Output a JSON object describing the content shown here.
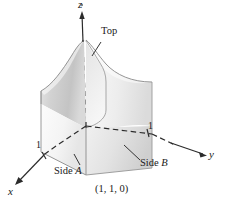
{
  "figure": {
    "caption_point": "(1, 1, 0)",
    "axes": [
      {
        "name": "z-axis",
        "label": "z"
      },
      {
        "name": "y-axis",
        "label": "y"
      },
      {
        "name": "x-axis",
        "label": "x"
      }
    ],
    "axis_labels": {
      "z": "z",
      "y": "y",
      "x": "x"
    },
    "ticks": {
      "x_tick": "1",
      "y_tick": "1"
    },
    "annotations": {
      "top": "Top",
      "side_a_word": "Side",
      "side_a_letter": "A",
      "side_b_word": "Side",
      "side_b_letter": "B"
    },
    "colors": {
      "axis_line": "#2b2b2b",
      "outline": "#6f6f6f",
      "surface_light": "#f4f4f4",
      "surface_mid": "#dcdcdc",
      "surface_dark": "#bdbdbd",
      "text": "#1a1a1a",
      "background": "#ffffff"
    }
  }
}
